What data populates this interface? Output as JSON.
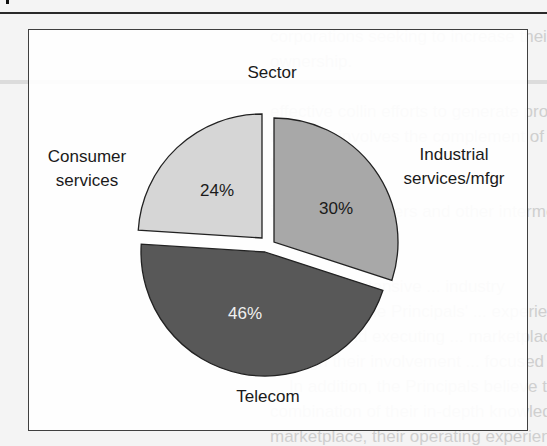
{
  "chart_data": {
    "type": "pie",
    "title": "Sector",
    "exploded": true,
    "slices": [
      {
        "label": "Industrial services/mfgr",
        "label_lines": [
          "Industrial",
          "services/mfgr"
        ],
        "value": 30,
        "display": "30%",
        "color": "#a8a8a8",
        "text_color": "#1a1a1a"
      },
      {
        "label": "Telecom",
        "label_lines": [
          "Telecom"
        ],
        "value": 46,
        "display": "46%",
        "color": "#585858",
        "text_color": "#f0f0f0"
      },
      {
        "label": "Consumer services",
        "label_lines": [
          "Consumer",
          "services"
        ],
        "value": 24,
        "display": "24%",
        "color": "#d6d6d6",
        "text_color": "#1a1a1a"
      }
    ]
  },
  "background_text": [
    "corporations seeking to increase their minority",
    "ownership.",
    "",
    "effective collin efforts to generate proprietory deal",
    "flow that involves the complement of the",
    "principals.",
    "",
    "investment bankers and other intermediaries",
    "",
    "",
    "principals' extensive ... industry",
    "experience, the Principals' ... experience",
    "sourcing and executing ... marketplace",
    "through their involvement ... focused",
    "... In addition, the Principals believe that the",
    "combination of their in-depth knowledge of the target",
    "marketplace, their operating experience, and their"
  ]
}
